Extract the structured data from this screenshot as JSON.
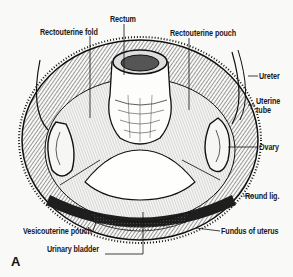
{
  "figure": {
    "panel_letter": "A",
    "labels": {
      "rectum": "Rectum",
      "rectouterine_fold": "Rectouterine fold",
      "rectouterine_pouch": "Rectouterine pouch",
      "ureter": "Ureter",
      "uterine_tube_line1": "Uterine",
      "uterine_tube_line2": "tube",
      "ovary": "Ovary",
      "round_lig": "Round lig.",
      "vesicouterine_pouch": "Vesicouterine pouch",
      "fundus_of_uterus": "Fundus of uterus",
      "urinary_bladder": "Urinary bladder"
    },
    "colors": {
      "ink": "#1a1a1a",
      "paper": "#f9f9f8"
    }
  }
}
